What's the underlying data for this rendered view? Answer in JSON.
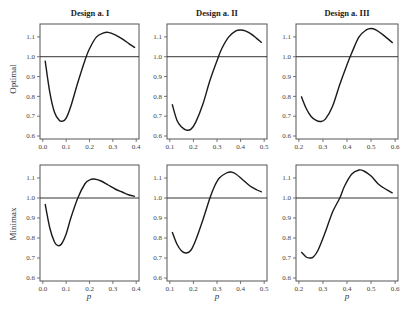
{
  "figure": {
    "col_titles": [
      "Design a. I",
      "Design a. II",
      "Design a. III"
    ],
    "row_labels": [
      "Optimal",
      "Minimax"
    ],
    "xlabel": "p"
  },
  "chart_data": [
    {
      "type": "line",
      "panel": "Optimal / Design a. I",
      "row": 0,
      "col": 0,
      "title": "Design a. I",
      "ylabel": "Optimal",
      "xlabel": "",
      "xlim": [
        0.0,
        0.4
      ],
      "ylim": [
        0.6,
        1.15
      ],
      "xticks": [
        0.0,
        0.1,
        0.2,
        0.3,
        0.4
      ],
      "yticks": [
        0.6,
        0.7,
        0.8,
        0.9,
        1.0,
        1.1
      ],
      "reference_line": 1.0,
      "x": [
        0.01,
        0.03,
        0.05,
        0.07,
        0.085,
        0.1,
        0.12,
        0.15,
        0.18,
        0.2,
        0.23,
        0.26,
        0.28,
        0.31,
        0.34,
        0.37,
        0.395
      ],
      "y": [
        0.98,
        0.82,
        0.72,
        0.68,
        0.675,
        0.69,
        0.75,
        0.87,
        0.98,
        1.04,
        1.1,
        1.12,
        1.123,
        1.11,
        1.09,
        1.065,
        1.045
      ]
    },
    {
      "type": "line",
      "panel": "Optimal / Design a. II",
      "row": 0,
      "col": 1,
      "title": "Design a. II",
      "ylabel": "",
      "xlabel": "",
      "xlim": [
        0.1,
        0.5
      ],
      "ylim": [
        0.6,
        1.15
      ],
      "xticks": [
        0.1,
        0.2,
        0.3,
        0.4,
        0.5
      ],
      "yticks": [
        0.6,
        0.7,
        0.8,
        0.9,
        1.0,
        1.1
      ],
      "reference_line": 1.0,
      "x": [
        0.11,
        0.13,
        0.15,
        0.17,
        0.19,
        0.21,
        0.24,
        0.27,
        0.3,
        0.32,
        0.35,
        0.38,
        0.4,
        0.42,
        0.45,
        0.49
      ],
      "y": [
        0.76,
        0.68,
        0.645,
        0.63,
        0.635,
        0.67,
        0.76,
        0.88,
        0.98,
        1.04,
        1.1,
        1.13,
        1.135,
        1.13,
        1.11,
        1.07
      ]
    },
    {
      "type": "line",
      "panel": "Optimal / Design a. III",
      "row": 0,
      "col": 2,
      "title": "Design a. III",
      "ylabel": "",
      "xlabel": "",
      "xlim": [
        0.2,
        0.6
      ],
      "ylim": [
        0.6,
        1.15
      ],
      "xticks": [
        0.2,
        0.3,
        0.4,
        0.5,
        0.6
      ],
      "yticks": [
        0.6,
        0.7,
        0.8,
        0.9,
        1.0,
        1.1
      ],
      "reference_line": 1.0,
      "x": [
        0.21,
        0.23,
        0.25,
        0.27,
        0.29,
        0.31,
        0.34,
        0.37,
        0.4,
        0.42,
        0.45,
        0.48,
        0.5,
        0.52,
        0.55,
        0.59
      ],
      "y": [
        0.8,
        0.74,
        0.7,
        0.68,
        0.673,
        0.685,
        0.75,
        0.86,
        0.96,
        1.02,
        1.1,
        1.135,
        1.142,
        1.135,
        1.11,
        1.07
      ]
    },
    {
      "type": "line",
      "panel": "Minimax / Design a. I",
      "row": 1,
      "col": 0,
      "title": "",
      "ylabel": "Minimax",
      "xlabel": "p",
      "xlim": [
        0.0,
        0.4
      ],
      "ylim": [
        0.6,
        1.15
      ],
      "xticks": [
        0.0,
        0.1,
        0.2,
        0.3,
        0.4
      ],
      "yticks": [
        0.6,
        0.7,
        0.8,
        0.9,
        1.0,
        1.1
      ],
      "reference_line": 1.0,
      "x": [
        0.01,
        0.03,
        0.05,
        0.065,
        0.08,
        0.1,
        0.12,
        0.15,
        0.18,
        0.2,
        0.22,
        0.25,
        0.28,
        0.31,
        0.34,
        0.37,
        0.395
      ],
      "y": [
        0.97,
        0.85,
        0.78,
        0.762,
        0.77,
        0.82,
        0.9,
        1.0,
        1.07,
        1.09,
        1.095,
        1.085,
        1.065,
        1.045,
        1.03,
        1.015,
        1.008
      ]
    },
    {
      "type": "line",
      "panel": "Minimax / Design a. II",
      "row": 1,
      "col": 1,
      "title": "",
      "ylabel": "",
      "xlabel": "p",
      "xlim": [
        0.1,
        0.5
      ],
      "ylim": [
        0.6,
        1.15
      ],
      "xticks": [
        0.1,
        0.2,
        0.3,
        0.4,
        0.5
      ],
      "yticks": [
        0.6,
        0.7,
        0.8,
        0.9,
        1.0,
        1.1
      ],
      "reference_line": 1.0,
      "x": [
        0.11,
        0.13,
        0.15,
        0.17,
        0.19,
        0.21,
        0.24,
        0.27,
        0.29,
        0.31,
        0.34,
        0.36,
        0.38,
        0.41,
        0.44,
        0.47,
        0.49
      ],
      "y": [
        0.83,
        0.77,
        0.735,
        0.725,
        0.74,
        0.79,
        0.89,
        1.0,
        1.06,
        1.1,
        1.125,
        1.13,
        1.12,
        1.09,
        1.06,
        1.04,
        1.03
      ]
    },
    {
      "type": "line",
      "panel": "Minimax / Design a. III",
      "row": 1,
      "col": 2,
      "title": "",
      "ylabel": "",
      "xlabel": "p",
      "xlim": [
        0.2,
        0.6
      ],
      "ylim": [
        0.6,
        1.15
      ],
      "xticks": [
        0.2,
        0.3,
        0.4,
        0.5,
        0.6
      ],
      "yticks": [
        0.6,
        0.7,
        0.8,
        0.9,
        1.0,
        1.1
      ],
      "reference_line": 1.0,
      "x": [
        0.21,
        0.23,
        0.245,
        0.26,
        0.28,
        0.31,
        0.34,
        0.37,
        0.39,
        0.42,
        0.45,
        0.47,
        0.5,
        0.53,
        0.56,
        0.59
      ],
      "y": [
        0.73,
        0.705,
        0.7,
        0.705,
        0.74,
        0.83,
        0.93,
        1.0,
        1.06,
        1.12,
        1.14,
        1.135,
        1.11,
        1.07,
        1.045,
        1.025
      ]
    }
  ]
}
